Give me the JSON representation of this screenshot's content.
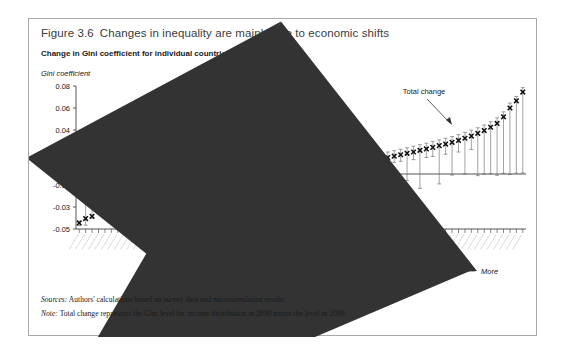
{
  "figure": {
    "number": "Figure 3.6",
    "title": "Changes in inequality are mainly due to economic shifts",
    "subtitle": "Change in Gini coefficient for individual countries",
    "ylabel": "Gini coefficient",
    "sources_label": "Sources:",
    "sources_text": "Authors' calculations based on survey data and microsimulation results.",
    "note_label": "Note:",
    "note_text": "Total change represents the Gini level for income distribution in 2030 minus the level in 2000."
  },
  "annotations": {
    "demographic": "Change due to\ndemographic shift",
    "demographic_line1": "Change due to",
    "demographic_line2": "demographic shift",
    "economic_line1": "Change due to",
    "economic_line2": "economic shift",
    "total": "Total change",
    "axis_less": "Less",
    "axis_more": "More",
    "axis_center": "Total change in income inequality"
  },
  "colors": {
    "frame": "#a9a9a9",
    "axis": "#555555",
    "marker": "#111111",
    "range_bar": "#8c8c8c",
    "zero_line": "#555555",
    "title": "#3c3c3c",
    "text": "#1a1a1a"
  },
  "chart_data": {
    "type": "scatter",
    "title": "Change in Gini coefficient for individual countries",
    "xlabel": "Total change in income inequality",
    "ylabel": "Gini coefficient",
    "ylim": [
      -0.05,
      0.08
    ],
    "yticks": [
      0.08,
      0.06,
      0.04,
      0.02,
      -0.01,
      -0.03,
      -0.05
    ],
    "ytick_labels": [
      "0.08",
      "0.06",
      "0.04",
      "0.02",
      "-0.01",
      "-0.03",
      "-0.05"
    ],
    "grid": false,
    "legend": "none",
    "zero_reference": 0.0,
    "n_countries": 70,
    "series": [
      {
        "name": "Total change",
        "marker": "x",
        "values": [
          -0.0445,
          -0.0405,
          -0.0385,
          -0.033,
          -0.0255,
          -0.025,
          -0.0248,
          -0.017,
          -0.0135,
          -0.013,
          -0.0128,
          -0.0125,
          -0.012,
          -0.0095,
          -0.0085,
          -0.008,
          -0.0075,
          -0.007,
          -0.0055,
          -0.0045,
          -0.0035,
          -0.0025,
          -0.0015,
          -0.0008,
          0.0,
          0.0004,
          0.0008,
          0.0012,
          0.0016,
          0.002,
          0.0026,
          0.0032,
          0.0038,
          0.0045,
          0.005,
          0.0056,
          0.0062,
          0.0068,
          0.0074,
          0.008,
          0.0086,
          0.0092,
          0.01,
          0.0108,
          0.0115,
          0.0122,
          0.013,
          0.014,
          0.015,
          0.0162,
          0.0175,
          0.0188,
          0.02,
          0.0215,
          0.0228,
          0.0242,
          0.0258,
          0.0272,
          0.0288,
          0.0305,
          0.0325,
          0.0345,
          0.037,
          0.0395,
          0.0425,
          0.046,
          0.052,
          0.06,
          0.0665,
          0.0745
        ]
      },
      {
        "name": "Range upper (demographic / economic bound)",
        "values": [
          -0.043,
          0.024,
          -0.0115,
          -0.0075,
          -0.003,
          -0.0065,
          -0.006,
          -0.001,
          0.0175,
          0.0,
          -0.0035,
          0.0,
          0.0,
          0.006,
          0.0055,
          0.006,
          0.006,
          0.023,
          0.0035,
          0.003,
          0.0035,
          0.0065,
          0.007,
          0.0045,
          0.0155,
          0.0055,
          0.0048,
          0.0052,
          0.006,
          0.0066,
          0.006,
          0.0078,
          0.009,
          0.01,
          0.0105,
          0.011,
          0.01,
          0.0105,
          0.0112,
          0.012,
          0.0128,
          0.0135,
          0.0142,
          0.015,
          0.0158,
          0.0168,
          0.0178,
          0.0188,
          0.02,
          0.0212,
          0.0225,
          0.0238,
          0.0252,
          0.0266,
          0.028,
          0.0295,
          0.031,
          0.0325,
          0.034,
          0.0358,
          0.0378,
          0.0398,
          0.042,
          0.0445,
          0.0475,
          0.051,
          0.0565,
          0.0645,
          0.0705,
          0.0785
        ]
      },
      {
        "name": "Range lower (demographic / economic bound)",
        "values": [
          -0.047,
          -0.0465,
          -0.04,
          -0.036,
          -0.029,
          -0.0285,
          -0.028,
          -0.0205,
          -0.0155,
          -0.016,
          -0.015,
          -0.024,
          -0.023,
          -0.0125,
          -0.0115,
          -0.011,
          -0.0105,
          -0.01,
          -0.009,
          -0.008,
          -0.007,
          -0.006,
          -0.005,
          -0.0045,
          -0.03,
          -0.003,
          -0.0026,
          -0.0022,
          -0.0018,
          -0.0012,
          -0.0006,
          0.0,
          0.0004,
          0.0008,
          0.0012,
          0.0016,
          -0.022,
          0.0022,
          0.0028,
          0.0034,
          0.004,
          0.0046,
          0.0052,
          0.006,
          -0.0395,
          0.0074,
          0.0082,
          0.009,
          -0.011,
          0.0106,
          0.0115,
          -0.006,
          0.013,
          -0.013,
          0.015,
          0.016,
          -0.009,
          0.018,
          -0.001,
          0.02,
          0.0,
          0.0222,
          -0.0015,
          0.0,
          0.0002,
          -0.0012,
          0.0005,
          -0.0005,
          0.0008,
          0.001
        ]
      }
    ]
  }
}
